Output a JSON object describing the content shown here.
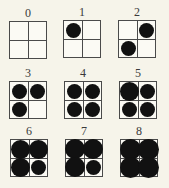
{
  "figure": {
    "colors": {
      "background": "#f6f4ea",
      "grid_line": "#4a4a4a",
      "dot": "#111111",
      "label": "#3a3a3a"
    },
    "patterns": [
      {
        "label": "0",
        "x": 9,
        "y": 7,
        "cells": {
          "tl": 0,
          "tr": 0,
          "bl": 0,
          "br": 0
        }
      },
      {
        "label": "1",
        "x": 63,
        "y": 6,
        "cells": {
          "tl": 1,
          "tr": 0,
          "bl": 0,
          "br": 0
        }
      },
      {
        "label": "2",
        "x": 118,
        "y": 6,
        "cells": {
          "tl": 0,
          "tr": 1,
          "bl": 1,
          "br": 0
        }
      },
      {
        "label": "3",
        "x": 9,
        "y": 67,
        "cells": {
          "tl": 1,
          "tr": 1,
          "bl": 1,
          "br": 0
        }
      },
      {
        "label": "4",
        "x": 64,
        "y": 67,
        "cells": {
          "tl": 1,
          "tr": 1,
          "bl": 1,
          "br": 1
        }
      },
      {
        "label": "5",
        "x": 119,
        "y": 67,
        "cells": {
          "tl": 2,
          "tr": 1,
          "bl": 1,
          "br": 1
        }
      },
      {
        "label": "6",
        "x": 10,
        "y": 125,
        "cells": {
          "tl": 2,
          "tr": 2,
          "bl": 2,
          "br": 1
        }
      },
      {
        "label": "7",
        "x": 65,
        "y": 125,
        "cells": {
          "tl": 2,
          "tr": 2,
          "bl": 2,
          "br": 1
        }
      },
      {
        "label": "8",
        "x": 120,
        "y": 125,
        "cells": {
          "tl": 2,
          "tr": 2,
          "bl": 2,
          "br": 2
        }
      }
    ],
    "dot_sizes": {
      "0": 0,
      "1": 15,
      "2": 19
    }
  }
}
